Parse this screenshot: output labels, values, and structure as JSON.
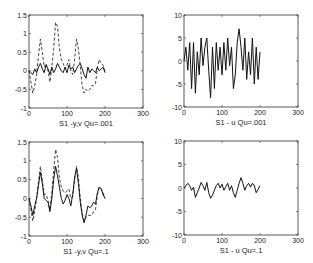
{
  "chart_data": [
    {
      "type": "line",
      "title": "S1 -y,v Qu=.001",
      "xlabel": "",
      "ylabel": "",
      "xlim": [
        0,
        300
      ],
      "ylim": [
        -1,
        1.5
      ],
      "xticks": [
        "0",
        "100",
        "200",
        "300"
      ],
      "yticks": [
        "-1",
        "-0.5",
        "0",
        "0.5",
        "1",
        "1.5"
      ],
      "grid": false,
      "series": [
        {
          "name": "y",
          "style": "solid",
          "x": [
            0,
            5,
            10,
            15,
            20,
            25,
            30,
            35,
            40,
            45,
            50,
            55,
            60,
            65,
            70,
            75,
            80,
            85,
            90,
            95,
            100,
            105,
            110,
            115,
            120,
            125,
            130,
            135,
            140,
            145,
            150,
            155,
            160,
            165,
            170,
            175,
            180,
            185,
            190,
            195,
            200
          ],
          "values": [
            0,
            -0.05,
            -0.1,
            0.05,
            -0.05,
            0.1,
            0.2,
            0.05,
            -0.05,
            0.15,
            0.05,
            -0.1,
            0.1,
            -0.05,
            0.05,
            0.2,
            0.1,
            0,
            -0.05,
            0.1,
            -0.05,
            0.15,
            0.05,
            0.1,
            -0.05,
            0.05,
            0.15,
            0.2,
            0.05,
            -0.1,
            -0.2,
            0.1,
            -0.05,
            0.05,
            0,
            -0.05,
            0.1,
            0,
            0.05,
            0.1,
            -0.05
          ]
        },
        {
          "name": "v",
          "style": "dashed",
          "x": [
            0,
            5,
            10,
            15,
            20,
            25,
            30,
            35,
            40,
            45,
            50,
            55,
            60,
            65,
            70,
            75,
            80,
            85,
            90,
            95,
            100,
            105,
            110,
            115,
            120,
            125,
            130,
            135,
            140,
            145,
            150,
            155,
            160,
            165,
            170,
            175,
            180,
            185,
            190,
            195,
            200
          ],
          "values": [
            0,
            -0.3,
            -0.6,
            -0.4,
            -0.1,
            0.4,
            0.85,
            0.5,
            0.1,
            0.2,
            0,
            -0.3,
            0.1,
            0.6,
            1.3,
            1.2,
            0.6,
            0.3,
            0.2,
            0.05,
            0.15,
            0.3,
            0,
            -0.1,
            0.3,
            0.85,
            0.6,
            0.1,
            -0.4,
            -0.6,
            -0.5,
            -0.55,
            -0.5,
            -0.4,
            -0.4,
            -0.35,
            0.1,
            0.3,
            0.2,
            0.15,
            0
          ]
        }
      ]
    },
    {
      "type": "line",
      "title": "S1 - u  Qu=.001",
      "xlabel": "",
      "ylabel": "",
      "xlim": [
        0,
        300
      ],
      "ylim": [
        -10,
        10
      ],
      "xticks": [
        "0",
        "100",
        "200",
        "300"
      ],
      "yticks": [
        "-10",
        "-5",
        "0",
        "5",
        "10"
      ],
      "grid": false,
      "series": [
        {
          "name": "u",
          "style": "solid",
          "x": [
            0,
            5,
            10,
            15,
            20,
            25,
            30,
            35,
            40,
            45,
            50,
            55,
            60,
            65,
            70,
            75,
            80,
            85,
            90,
            95,
            100,
            105,
            110,
            115,
            120,
            125,
            130,
            135,
            140,
            145,
            150,
            155,
            160,
            165,
            170,
            175,
            180,
            185,
            190,
            195,
            200
          ],
          "values": [
            0,
            3,
            -2,
            4,
            -6,
            4,
            -7,
            2,
            -3,
            5,
            -1,
            3,
            5,
            -2,
            -8,
            3,
            -6,
            4,
            -2,
            3,
            -3,
            4,
            -2,
            5,
            -1,
            3,
            -6,
            -3,
            4,
            7,
            3,
            -2,
            5,
            -4,
            2,
            -3,
            5,
            -5,
            3,
            -4,
            2
          ]
        }
      ]
    },
    {
      "type": "line",
      "title": "S1 -y,v Qu=.1",
      "xlabel": "",
      "ylabel": "",
      "xlim": [
        0,
        300
      ],
      "ylim": [
        -1,
        1.5
      ],
      "xticks": [
        "0",
        "100",
        "200",
        "300"
      ],
      "yticks": [
        "-1",
        "-0.5",
        "0",
        "0.5",
        "1",
        "1.5"
      ],
      "grid": false,
      "series": [
        {
          "name": "y",
          "style": "solid",
          "x": [
            0,
            5,
            10,
            15,
            20,
            25,
            30,
            35,
            40,
            45,
            50,
            55,
            60,
            65,
            70,
            75,
            80,
            85,
            90,
            95,
            100,
            105,
            110,
            115,
            120,
            125,
            130,
            135,
            140,
            145,
            150,
            155,
            160,
            165,
            170,
            175,
            180,
            185,
            190,
            195,
            200
          ],
          "values": [
            0,
            -0.2,
            -0.45,
            -0.2,
            0,
            0.35,
            0.7,
            0.4,
            0,
            -0.05,
            -0.1,
            -0.35,
            0,
            0.5,
            0.85,
            0.6,
            0.3,
            0,
            -0.15,
            -0.05,
            0.1,
            0,
            -0.2,
            0.1,
            0.55,
            0.8,
            0.4,
            -0.1,
            -0.45,
            -0.65,
            -0.45,
            -0.2,
            -0.25,
            -0.2,
            -0.1,
            -0.15,
            0.15,
            0.3,
            0.25,
            0.1,
            0
          ]
        },
        {
          "name": "v",
          "style": "dashed",
          "x": [
            0,
            5,
            10,
            15,
            20,
            25,
            30,
            35,
            40,
            45,
            50,
            55,
            60,
            65,
            70,
            75,
            80,
            85,
            90,
            95,
            100,
            105,
            110,
            115,
            120,
            125,
            130,
            135,
            140,
            145,
            150,
            155,
            160,
            165,
            170,
            175,
            180,
            185,
            190,
            195,
            200
          ],
          "values": [
            0,
            -0.3,
            -0.6,
            -0.35,
            0,
            0.45,
            0.85,
            0.5,
            0.1,
            0.1,
            -0.05,
            -0.3,
            0.15,
            0.75,
            1.3,
            1.1,
            0.55,
            0.3,
            0.2,
            0.15,
            0.2,
            0.25,
            0,
            0.05,
            0.5,
            0.85,
            0.55,
            0,
            -0.4,
            -0.6,
            -0.5,
            -0.45,
            -0.45,
            -0.45,
            -0.35,
            -0.3,
            0.1,
            0.3,
            0.25,
            0.15,
            0
          ]
        }
      ]
    },
    {
      "type": "line",
      "title": "S1 - u  Qu=.1",
      "xlabel": "",
      "ylabel": "",
      "xlim": [
        0,
        300
      ],
      "ylim": [
        -10,
        10
      ],
      "xticks": [
        "0",
        "100",
        "200",
        "300"
      ],
      "yticks": [
        "-10",
        "-5",
        "0",
        "5",
        "10"
      ],
      "grid": false,
      "series": [
        {
          "name": "u",
          "style": "solid",
          "x": [
            0,
            5,
            10,
            15,
            20,
            25,
            30,
            35,
            40,
            45,
            50,
            55,
            60,
            65,
            70,
            75,
            80,
            85,
            90,
            95,
            100,
            105,
            110,
            115,
            120,
            125,
            130,
            135,
            140,
            145,
            150,
            155,
            160,
            165,
            170,
            175,
            180,
            185,
            190,
            195,
            200
          ],
          "values": [
            0,
            0.5,
            1,
            0.5,
            -0.5,
            0.2,
            -2,
            -1,
            0,
            1.2,
            0.5,
            -0.5,
            1.2,
            -1,
            -2.2,
            -1.5,
            -0.5,
            0.5,
            1,
            0,
            0.8,
            -0.5,
            0.3,
            1,
            -0.5,
            0.5,
            -1,
            -2,
            -0.5,
            1,
            2.2,
            1,
            -0.5,
            0.5,
            1,
            0.2,
            1,
            0.5,
            -1,
            -0.3,
            0.5
          ]
        }
      ]
    }
  ],
  "panels": [
    {
      "title": "S1 -y,v Qu=.001"
    },
    {
      "title": "S1 - u  Qu=.001"
    },
    {
      "title": "S1 -y,v Qu=.1"
    },
    {
      "title": "S1 - u  Qu=.1"
    }
  ]
}
